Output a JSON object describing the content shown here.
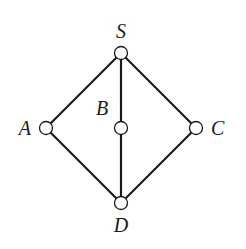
{
  "diagram": {
    "type": "hasse-diagram",
    "nodes": [
      {
        "id": "S",
        "label": "S",
        "x": 121,
        "y": 53,
        "lx": 121,
        "ly": 38,
        "anchor": "middle"
      },
      {
        "id": "A",
        "label": "A",
        "x": 46,
        "y": 128,
        "lx": 31,
        "ly": 135,
        "anchor": "end"
      },
      {
        "id": "B",
        "label": "B",
        "x": 121,
        "y": 128,
        "lx": 102,
        "ly": 115,
        "anchor": "middle"
      },
      {
        "id": "C",
        "label": "C",
        "x": 196,
        "y": 128,
        "lx": 211,
        "ly": 135,
        "anchor": "start"
      },
      {
        "id": "D",
        "label": "D",
        "x": 121,
        "y": 203,
        "lx": 121,
        "ly": 232,
        "anchor": "middle"
      }
    ],
    "edges": [
      {
        "from": "S",
        "to": "A"
      },
      {
        "from": "S",
        "to": "B"
      },
      {
        "from": "S",
        "to": "C"
      },
      {
        "from": "A",
        "to": "D"
      },
      {
        "from": "B",
        "to": "D"
      },
      {
        "from": "C",
        "to": "D"
      }
    ],
    "colors": {
      "stroke": "#1a1a1a",
      "node_fill": "#ffffff"
    }
  }
}
